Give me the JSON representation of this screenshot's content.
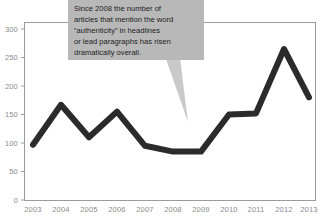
{
  "chart_data": {
    "type": "line",
    "title": "",
    "xlabel": "",
    "ylabel": "",
    "categories": [
      "2003",
      "2004",
      "2005",
      "2006",
      "2007",
      "2008",
      "2009",
      "2010",
      "2011",
      "2012",
      "2013"
    ],
    "values": [
      97,
      167,
      110,
      155,
      95,
      85,
      85,
      150,
      152,
      265,
      180
    ],
    "series": [
      {
        "name": "Articles mentioning “authenticity”",
        "values": [
          97,
          167,
          110,
          155,
          95,
          85,
          85,
          150,
          152,
          265,
          180
        ]
      }
    ],
    "ylim": [
      0,
      300
    ],
    "yticks": [
      0,
      50,
      100,
      150,
      200,
      250,
      300
    ],
    "ytick_labels": [
      "0",
      "50",
      "100",
      "150",
      "200",
      "250",
      "300"
    ],
    "grid": false,
    "legend": "none",
    "line_color": "#2b2b2b",
    "annotations": [
      {
        "id": "callout",
        "lines": [
          "Since 2008 the number of",
          "articles that mention the word",
          "“authenticity” in headlines",
          "or lead paragraphs has risen",
          "dramatically overall."
        ],
        "text": "Since 2008 the number of articles that mention the word “authenticity” in headlines or lead paragraphs has risen dramatically overall.",
        "points_to": "2009",
        "box_color": "#b8b8b8",
        "text_color": "#1d1d1d"
      }
    ]
  },
  "axes": {
    "y_ticks": [
      {
        "label": "300",
        "value": 300
      },
      {
        "label": "250",
        "value": 250
      },
      {
        "label": "200",
        "value": 200
      },
      {
        "label": "150",
        "value": 150
      },
      {
        "label": "100",
        "value": 100
      },
      {
        "label": "50",
        "value": 50
      },
      {
        "label": "0",
        "value": 0
      }
    ],
    "x_ticks": [
      {
        "label": "2003"
      },
      {
        "label": "2004"
      },
      {
        "label": "2005"
      },
      {
        "label": "2006"
      },
      {
        "label": "2007"
      },
      {
        "label": "2008"
      },
      {
        "label": "2009"
      },
      {
        "label": "2010"
      },
      {
        "label": "2011"
      },
      {
        "label": "2012"
      },
      {
        "label": "2013"
      }
    ],
    "frame_color": "#9b9b9b"
  },
  "annotation": {
    "line1": "Since 2008 the number of",
    "line2": "articles that mention the word",
    "line3": "“authenticity” in headlines",
    "line4": "or lead paragraphs has risen",
    "line5": "dramatically overall."
  }
}
